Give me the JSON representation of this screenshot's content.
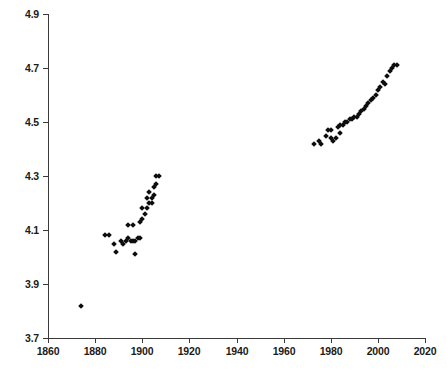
{
  "chart_data": {
    "type": "scatter",
    "title": "",
    "subtitle": "",
    "xlabel": "",
    "ylabel": "",
    "xlim": [
      1860,
      2020
    ],
    "ylim": [
      3.7,
      4.9
    ],
    "xticks": [
      1860,
      1880,
      1900,
      1920,
      1940,
      1960,
      1980,
      2000,
      2020
    ],
    "yticks": [
      3.7,
      3.9,
      4.1,
      4.3,
      4.5,
      4.7,
      4.9
    ],
    "xtick_labels": [
      "1860",
      "1880",
      "1900",
      "1920",
      "1940",
      "1960",
      "1980",
      "2000",
      "2020"
    ],
    "ytick_labels": [
      "3.7",
      "3.9",
      "4.1",
      "4.3",
      "4.5",
      "4.7",
      "4.9"
    ],
    "grid": false,
    "legend": false,
    "legend_position": "none",
    "marker": "diamond",
    "marker_color": "#0d0d0d",
    "marker_size": 4,
    "axis_color": "#3a3a3a",
    "background_color": "#ffffff",
    "series": [
      {
        "name": "series-1",
        "points": [
          [
            1874,
            3.82
          ],
          [
            1884,
            4.08
          ],
          [
            1886,
            4.08
          ],
          [
            1888,
            4.05
          ],
          [
            1889,
            4.02
          ],
          [
            1891,
            4.06
          ],
          [
            1892,
            4.05
          ],
          [
            1893,
            4.06
          ],
          [
            1894,
            4.07
          ],
          [
            1894,
            4.12
          ],
          [
            1895,
            4.06
          ],
          [
            1896,
            4.06
          ],
          [
            1896,
            4.12
          ],
          [
            1897,
            4.06
          ],
          [
            1897,
            4.01
          ],
          [
            1898,
            4.07
          ],
          [
            1899,
            4.07
          ],
          [
            1899,
            4.13
          ],
          [
            1900,
            4.14
          ],
          [
            1900,
            4.18
          ],
          [
            1901,
            4.16
          ],
          [
            1902,
            4.18
          ],
          [
            1902,
            4.22
          ],
          [
            1903,
            4.2
          ],
          [
            1903,
            4.24
          ],
          [
            1904,
            4.22
          ],
          [
            1904,
            4.2
          ],
          [
            1905,
            4.26
          ],
          [
            1905,
            4.23
          ],
          [
            1906,
            4.3
          ],
          [
            1906,
            4.27
          ],
          [
            1907,
            4.3
          ],
          [
            1973,
            4.42
          ],
          [
            1975,
            4.43
          ],
          [
            1976,
            4.42
          ],
          [
            1978,
            4.45
          ],
          [
            1979,
            4.47
          ],
          [
            1980,
            4.47
          ],
          [
            1980,
            4.44
          ],
          [
            1981,
            4.43
          ],
          [
            1982,
            4.44
          ],
          [
            1983,
            4.48
          ],
          [
            1984,
            4.46
          ],
          [
            1984,
            4.49
          ],
          [
            1985,
            4.49
          ],
          [
            1986,
            4.5
          ],
          [
            1987,
            4.5
          ],
          [
            1988,
            4.51
          ],
          [
            1989,
            4.51
          ],
          [
            1990,
            4.52
          ],
          [
            1991,
            4.52
          ],
          [
            1992,
            4.53
          ],
          [
            1993,
            4.54
          ],
          [
            1994,
            4.55
          ],
          [
            1995,
            4.56
          ],
          [
            1996,
            4.57
          ],
          [
            1997,
            4.58
          ],
          [
            1998,
            4.59
          ],
          [
            1999,
            4.6
          ],
          [
            2000,
            4.62
          ],
          [
            2001,
            4.63
          ],
          [
            2002,
            4.65
          ],
          [
            2003,
            4.64
          ],
          [
            2004,
            4.67
          ],
          [
            2005,
            4.69
          ],
          [
            2006,
            4.7
          ],
          [
            2007,
            4.71
          ],
          [
            2008,
            4.71
          ]
        ]
      }
    ]
  }
}
